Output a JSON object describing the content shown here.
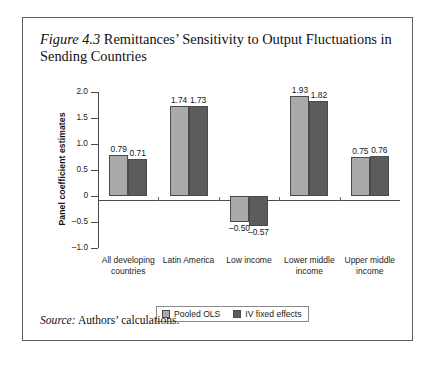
{
  "figure": {
    "number": "Figure 4.3",
    "title_rest": " Remittances’ Sensitivity to Output Fluctuations in Sending Countries",
    "source_keyword": "Source:",
    "source_text": " Authors’ calculations."
  },
  "colors": {
    "pooled_ols": "#a9a9a9",
    "iv_fixed_effects": "#5c5c5c",
    "axis": "#4a4a4a",
    "border": "#5d5d5d"
  },
  "chart_data": {
    "type": "bar",
    "title": "Figure 4.3 Remittances’ Sensitivity to Output Fluctuations in Sending Countries",
    "xlabel": "",
    "ylabel": "Panel coefficient estimates",
    "ylim": [
      -1.0,
      2.0
    ],
    "yticks": [
      2.0,
      1.5,
      1.0,
      0.5,
      0,
      -0.5,
      -1.0
    ],
    "ytick_labels": [
      "2.0",
      "1.5",
      "1.0",
      "0.5",
      "0",
      "–0.5",
      "–1.0"
    ],
    "grid": false,
    "legend_position": "bottom",
    "categories": [
      "All developing countries",
      "Latin America",
      "Low income",
      "Lower middle income",
      "Upper middle income"
    ],
    "category_lines": [
      [
        "All developing",
        "countries"
      ],
      [
        "Latin America",
        ""
      ],
      [
        "Low income",
        ""
      ],
      [
        "Lower middle",
        "income"
      ],
      [
        "Upper middle",
        "income"
      ]
    ],
    "series": [
      {
        "name": "Pooled OLS",
        "values": [
          0.79,
          1.74,
          -0.5,
          1.93,
          0.75
        ],
        "labels": [
          "0.79",
          "1.74",
          "–0.50",
          "1.93",
          "0.75"
        ]
      },
      {
        "name": "IV fixed effects",
        "values": [
          0.71,
          1.73,
          -0.57,
          1.82,
          0.76
        ],
        "labels": [
          "0.71",
          "1.73",
          "–0.57",
          "1.82",
          "0.76"
        ]
      }
    ]
  }
}
